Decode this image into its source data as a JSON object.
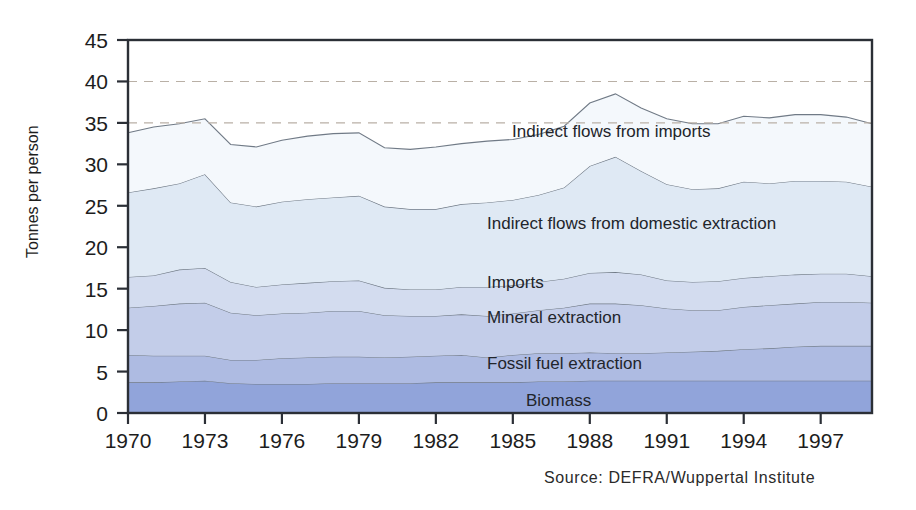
{
  "axes": {
    "y_title": "Tonnes per person",
    "y_ticks": [
      "0",
      "5",
      "10",
      "15",
      "20",
      "25",
      "30",
      "35",
      "40",
      "45"
    ],
    "x_ticks": [
      "1970",
      "1973",
      "1976",
      "1979",
      "1982",
      "1985",
      "1988",
      "1991",
      "1994",
      "1997"
    ]
  },
  "source": {
    "text": "Source: DEFRA/Wuppertal Institute"
  },
  "series_labels": {
    "indirect_imports": "Indirect flows from imports",
    "indirect_domestic": "Indirect flows from domestic extraction",
    "imports": "Imports",
    "mineral": "Mineral extraction",
    "fossil": "Fossil fuel extraction",
    "biomass": "Biomass"
  },
  "colors": {
    "biomass": "#91a4da",
    "fossil": "#aebbe2",
    "mineral": "#c3cde9",
    "imports": "#d3dcef",
    "indirect_domestic": "#dfe9f4",
    "indirect_imports": "#f4f8fc",
    "frame": "#2b2f36",
    "gridline": "#b9b0a6",
    "outline": "#707a86"
  },
  "chart_data": {
    "type": "area",
    "title": "",
    "xlabel": "",
    "ylabel": "Tonnes per person",
    "xlim": [
      1970,
      1999
    ],
    "ylim": [
      0,
      45
    ],
    "grid": "horizontal dashed at 35 and 40",
    "legend": "inline labels inside bands",
    "stacked": true,
    "x": [
      1970,
      1971,
      1972,
      1973,
      1974,
      1975,
      1976,
      1977,
      1978,
      1979,
      1980,
      1981,
      1982,
      1983,
      1984,
      1985,
      1986,
      1987,
      1988,
      1989,
      1990,
      1991,
      1992,
      1993,
      1994,
      1995,
      1996,
      1997,
      1998,
      1999
    ],
    "categories": [
      "1970",
      "1971",
      "1972",
      "1973",
      "1974",
      "1975",
      "1976",
      "1977",
      "1978",
      "1979",
      "1980",
      "1981",
      "1982",
      "1983",
      "1984",
      "1985",
      "1986",
      "1987",
      "1988",
      "1989",
      "1990",
      "1991",
      "1992",
      "1993",
      "1994",
      "1995",
      "1996",
      "1997",
      "1998",
      "1999"
    ],
    "series": [
      {
        "name": "Biomass",
        "values": [
          3.7,
          3.7,
          3.8,
          3.9,
          3.6,
          3.5,
          3.5,
          3.5,
          3.6,
          3.6,
          3.6,
          3.6,
          3.7,
          3.7,
          3.7,
          3.7,
          3.8,
          3.8,
          3.9,
          3.9,
          3.9,
          3.9,
          3.9,
          3.9,
          3.9,
          3.9,
          3.9,
          3.9,
          3.9,
          3.9
        ]
      },
      {
        "name": "Fossil fuel extraction",
        "values": [
          3.3,
          3.2,
          3.1,
          3.0,
          2.8,
          2.9,
          3.1,
          3.2,
          3.2,
          3.2,
          3.1,
          3.2,
          3.2,
          3.3,
          3.0,
          3.3,
          3.4,
          3.4,
          3.4,
          3.3,
          3.3,
          3.4,
          3.5,
          3.6,
          3.8,
          3.9,
          4.1,
          4.2,
          4.2,
          4.2
        ]
      },
      {
        "name": "Mineral extraction",
        "values": [
          5.7,
          6.0,
          6.3,
          6.4,
          5.7,
          5.4,
          5.4,
          5.4,
          5.5,
          5.5,
          5.1,
          4.9,
          4.8,
          4.9,
          5.0,
          5.0,
          5.2,
          5.5,
          5.9,
          6.0,
          5.8,
          5.3,
          5.0,
          4.9,
          5.1,
          5.2,
          5.2,
          5.3,
          5.3,
          5.2
        ]
      },
      {
        "name": "Imports",
        "values": [
          3.7,
          3.7,
          4.1,
          4.2,
          3.7,
          3.4,
          3.5,
          3.6,
          3.6,
          3.7,
          3.3,
          3.2,
          3.2,
          3.3,
          3.5,
          3.4,
          3.4,
          3.5,
          3.7,
          3.8,
          3.7,
          3.4,
          3.4,
          3.5,
          3.5,
          3.5,
          3.5,
          3.4,
          3.4,
          3.2
        ]
      },
      {
        "name": "Indirect flows from domestic extraction",
        "values": [
          10.2,
          10.5,
          10.4,
          11.3,
          9.6,
          9.7,
          10.0,
          10.1,
          10.1,
          10.2,
          9.8,
          9.7,
          9.7,
          10.0,
          10.2,
          10.3,
          10.5,
          11.0,
          12.9,
          13.9,
          12.5,
          11.6,
          11.2,
          11.2,
          11.6,
          11.2,
          11.3,
          11.2,
          11.1,
          10.8
        ]
      },
      {
        "name": "Indirect flows from imports",
        "values": [
          7.2,
          7.4,
          7.2,
          6.7,
          7.0,
          7.2,
          7.4,
          7.6,
          7.7,
          7.6,
          7.1,
          7.2,
          7.5,
          7.3,
          7.4,
          7.3,
          7.3,
          7.4,
          7.6,
          7.6,
          7.6,
          7.9,
          7.9,
          7.8,
          7.9,
          7.9,
          8.0,
          8.0,
          7.8,
          7.6
        ]
      }
    ],
    "cumulative_totals": [
      33.8,
      34.5,
      34.9,
      35.5,
      32.4,
      32.1,
      32.9,
      33.4,
      33.7,
      33.8,
      32.0,
      31.8,
      32.1,
      32.5,
      32.8,
      33.0,
      33.6,
      34.6,
      37.4,
      38.5,
      36.8,
      35.5,
      34.9,
      34.9,
      35.8,
      35.6,
      36.0,
      36.0,
      35.7,
      34.9
    ]
  }
}
